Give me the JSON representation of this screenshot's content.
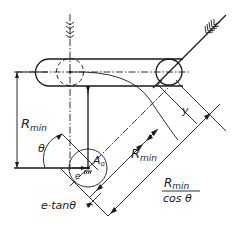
{
  "diagram": {
    "type": "mechanism-roller-follower",
    "labels": {
      "r_min_vertical": "R",
      "r_min_vertical_sub": "min",
      "theta": "θ",
      "e": "e",
      "a0": "A",
      "a0_sub": "o",
      "y": "y",
      "r_min_diagonal": "R",
      "r_min_diagonal_sub": "min",
      "fraction_numerator": "R",
      "fraction_numerator_sub": "min",
      "fraction_denominator": "cos θ",
      "e_tan_theta": "e·tanθ"
    },
    "colors": {
      "ink": "#1a1a1a",
      "background": "#ffffff"
    }
  }
}
